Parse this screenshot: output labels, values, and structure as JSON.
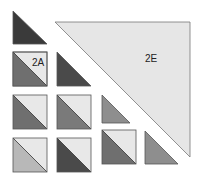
{
  "diagram": {
    "labels": {
      "piece_2a": "2A",
      "piece_2e": "2E"
    },
    "colors": {
      "dark": "#3a3a3a",
      "medium_dark": "#6f6f6f",
      "medium": "#8e8e8e",
      "light_medium": "#b8b8b8",
      "light": "#e8e8e8",
      "outline": "#555555"
    },
    "grid": {
      "rows": [
        [
          "dark-triangle",
          null,
          null,
          null
        ],
        [
          "split-square-medium-dark (2A)",
          "dark-triangle",
          null,
          null
        ],
        [
          "split-square-medium-dark",
          "split-square-medium",
          "medium-triangle",
          null
        ],
        [
          "split-square-light-medium",
          "split-square-dark",
          "split-square-medium-dark",
          "medium-triangle"
        ]
      ],
      "large_triangle": "2E (light)"
    }
  }
}
